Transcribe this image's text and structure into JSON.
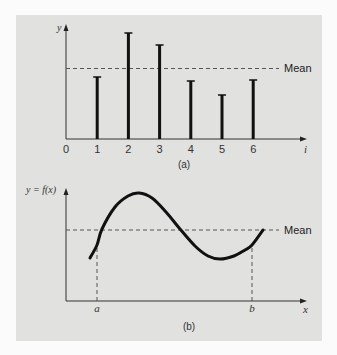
{
  "chart_data": [
    {
      "panel": "a",
      "type": "bar",
      "style": "stem",
      "caption": "(a)",
      "xlabel": "i",
      "ylabel": "y",
      "x_ticks": [
        "0",
        "1",
        "2",
        "3",
        "4",
        "5",
        "6"
      ],
      "categories": [
        1,
        2,
        3,
        4,
        5,
        6
      ],
      "values": [
        62,
        106,
        94,
        58,
        44,
        59
      ],
      "value_units": "relative (px above axis)",
      "mean": 70.5,
      "mean_label": "Mean",
      "mean_style": "dashed",
      "grid": false,
      "legend": null
    },
    {
      "panel": "b",
      "type": "line",
      "caption": "(b)",
      "xlabel": "x",
      "ylabel": "y = f(x)",
      "x_markers": [
        {
          "label": "a",
          "x": 97
        },
        {
          "label": "b",
          "x": 252
        }
      ],
      "curve_points": [
        [
          90,
          258
        ],
        [
          97,
          245
        ],
        [
          102,
          229
        ],
        [
          115,
          207
        ],
        [
          128,
          196
        ],
        [
          139,
          193
        ],
        [
          152,
          198
        ],
        [
          166,
          212
        ],
        [
          180,
          229
        ],
        [
          195,
          246
        ],
        [
          208,
          256
        ],
        [
          220,
          259
        ],
        [
          234,
          256
        ],
        [
          245,
          250
        ],
        [
          252,
          245
        ],
        [
          263,
          230
        ]
      ],
      "mean_label": "Mean",
      "mean_style": "dashed",
      "grid": false,
      "legend": null
    }
  ],
  "labels": {
    "a_caption": "(a)",
    "b_caption": "(b)",
    "a_mean": "Mean",
    "b_mean": "Mean",
    "a_ylabel": "y",
    "a_xlabel": "i",
    "b_ylabel": "y = f(x)",
    "b_xlabel": "x",
    "b_marker_a": "a",
    "b_marker_b": "b",
    "ticks": [
      "0",
      "1",
      "2",
      "3",
      "4",
      "5",
      "6"
    ]
  },
  "colors": {
    "panel_bg": "#e1e1df",
    "page_bg": "#fbfbfb",
    "ink": "#111111",
    "dash": "#555555"
  }
}
